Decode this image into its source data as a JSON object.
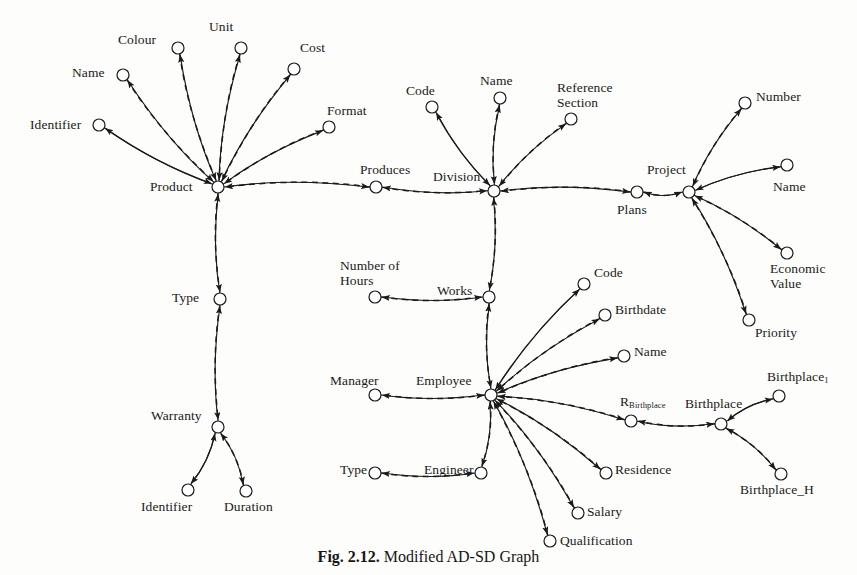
{
  "figure": {
    "caption_prefix": "Fig. 2.12.",
    "caption_text": " Modified AD-SD Graph",
    "caption_full": "Fig. 2.12. Modified AD-SD Graph"
  },
  "style": {
    "node_radius": 6,
    "node_stroke": "#1a1a1a",
    "node_fill": "#ffffff",
    "edge_color": "#1a1a1a",
    "solid_edge_label": "solid arrow (derivation edge)",
    "dashed_edge_label": "dashed arrow (dependency edge)"
  },
  "nodes": [
    {
      "id": "product",
      "label": "Product",
      "x": 218,
      "y": 187,
      "lx": 150,
      "ly": 180,
      "align": "left"
    },
    {
      "id": "p_identifier",
      "label": "Identifier",
      "x": 99,
      "y": 125,
      "lx": 30,
      "ly": 118,
      "align": "left"
    },
    {
      "id": "p_name",
      "label": "Name",
      "x": 123,
      "y": 75,
      "lx": 72,
      "ly": 66,
      "align": "left"
    },
    {
      "id": "p_colour",
      "label": "Colour",
      "x": 178,
      "y": 48,
      "lx": 118,
      "ly": 33,
      "align": "left"
    },
    {
      "id": "p_unit",
      "label": "Unit",
      "x": 241,
      "y": 48,
      "lx": 209,
      "ly": 20,
      "align": "left"
    },
    {
      "id": "p_cost",
      "label": "Cost",
      "x": 294,
      "y": 69,
      "lx": 300,
      "ly": 41,
      "align": "left"
    },
    {
      "id": "p_format",
      "label": "Format",
      "x": 329,
      "y": 127,
      "lx": 327,
      "ly": 104,
      "align": "left"
    },
    {
      "id": "type1",
      "label": "Type",
      "x": 220,
      "y": 299,
      "lx": 172,
      "ly": 291,
      "align": "left"
    },
    {
      "id": "warranty",
      "label": "Warranty",
      "x": 218,
      "y": 427,
      "lx": 151,
      "ly": 409,
      "align": "left"
    },
    {
      "id": "w_identifier",
      "label": "Identifier",
      "x": 188,
      "y": 490,
      "lx": 141,
      "ly": 500,
      "align": "left"
    },
    {
      "id": "w_duration",
      "label": "Duration",
      "x": 246,
      "y": 491,
      "lx": 224,
      "ly": 500,
      "align": "left"
    },
    {
      "id": "produces",
      "label": "Produces",
      "x": 376,
      "y": 187,
      "lx": 360,
      "ly": 163,
      "align": "left"
    },
    {
      "id": "division",
      "label": "Division",
      "x": 494,
      "y": 191,
      "lx": 433,
      "ly": 170,
      "align": "left"
    },
    {
      "id": "d_code",
      "label": "Code",
      "x": 432,
      "y": 107,
      "lx": 406,
      "ly": 84,
      "align": "left"
    },
    {
      "id": "d_name",
      "label": "Name",
      "x": 500,
      "y": 98,
      "lx": 480,
      "ly": 74,
      "align": "left"
    },
    {
      "id": "d_refsection",
      "label": "Reference\nSection",
      "x": 571,
      "y": 119,
      "lx": 557,
      "ly": 81,
      "align": "left"
    },
    {
      "id": "plans",
      "label": "Plans",
      "x": 637,
      "y": 192,
      "lx": 617,
      "ly": 203,
      "align": "left"
    },
    {
      "id": "project",
      "label": "Project",
      "x": 689,
      "y": 192,
      "lx": 647,
      "ly": 163,
      "align": "left"
    },
    {
      "id": "pr_number",
      "label": "Number",
      "x": 745,
      "y": 103,
      "lx": 756,
      "ly": 90,
      "align": "left"
    },
    {
      "id": "pr_name",
      "label": "Name",
      "x": 787,
      "y": 165,
      "lx": 773,
      "ly": 180,
      "align": "left"
    },
    {
      "id": "pr_economicvalue",
      "label": "Economic\nValue",
      "x": 787,
      "y": 253,
      "lx": 770,
      "ly": 262,
      "align": "left"
    },
    {
      "id": "pr_priority",
      "label": "Priority",
      "x": 749,
      "y": 320,
      "lx": 755,
      "ly": 326,
      "align": "left"
    },
    {
      "id": "works",
      "label": "Works",
      "x": 489,
      "y": 297,
      "lx": 437,
      "ly": 284,
      "align": "left"
    },
    {
      "id": "numberofhours",
      "label": "Number of\nHours",
      "x": 375,
      "y": 297,
      "lx": 340,
      "ly": 259,
      "align": "left"
    },
    {
      "id": "employee",
      "label": "Employee",
      "x": 491,
      "y": 395,
      "lx": 416,
      "ly": 374,
      "align": "left"
    },
    {
      "id": "manager",
      "label": "Manager",
      "x": 375,
      "y": 395,
      "lx": 330,
      "ly": 374,
      "align": "left"
    },
    {
      "id": "engineer",
      "label": "Engineer",
      "x": 481,
      "y": 473,
      "lx": 424,
      "ly": 463,
      "align": "left"
    },
    {
      "id": "e_type",
      "label": "Type",
      "x": 375,
      "y": 473,
      "lx": 340,
      "ly": 463,
      "align": "left"
    },
    {
      "id": "e_code",
      "label": "Code",
      "x": 584,
      "y": 284,
      "lx": 594,
      "ly": 266,
      "align": "left"
    },
    {
      "id": "e_birthdate",
      "label": "Birthdate",
      "x": 605,
      "y": 315,
      "lx": 615,
      "ly": 303,
      "align": "left"
    },
    {
      "id": "e_name",
      "label": "Name",
      "x": 624,
      "y": 356,
      "lx": 634,
      "ly": 345,
      "align": "left"
    },
    {
      "id": "e_rbirthplace",
      "label": "R",
      "sub": "Birthplace",
      "x": 631,
      "y": 421,
      "lx": 620,
      "ly": 395,
      "align": "left"
    },
    {
      "id": "e_residence",
      "label": "Residence",
      "x": 606,
      "y": 473,
      "lx": 615,
      "ly": 463,
      "align": "left"
    },
    {
      "id": "e_salary",
      "label": "Salary",
      "x": 578,
      "y": 513,
      "lx": 587,
      "ly": 505,
      "align": "left"
    },
    {
      "id": "e_qualification",
      "label": "Qualification",
      "x": 550,
      "y": 541,
      "lx": 560,
      "ly": 534,
      "align": "left"
    },
    {
      "id": "birthplace",
      "label": "Birthplace",
      "x": 721,
      "y": 424,
      "lx": 685,
      "ly": 397,
      "align": "left"
    },
    {
      "id": "birthplace1",
      "label": "Birthplace",
      "sub": "1",
      "x": 779,
      "y": 396,
      "lx": 767,
      "ly": 370,
      "align": "left"
    },
    {
      "id": "birthplace_h",
      "label": "Birthplace_H",
      "x": 781,
      "y": 474,
      "lx": 740,
      "ly": 483,
      "align": "left"
    }
  ],
  "edges": [
    {
      "from": "product",
      "to": "p_identifier",
      "style": "solid",
      "route": "bow"
    },
    {
      "from": "p_identifier",
      "to": "product",
      "style": "solid",
      "route": "bow2"
    },
    {
      "from": "product",
      "to": "p_name",
      "style": "solid"
    },
    {
      "from": "p_name",
      "to": "product",
      "style": "dashed",
      "route": "bow"
    },
    {
      "from": "product",
      "to": "p_colour",
      "style": "solid"
    },
    {
      "from": "p_colour",
      "to": "product",
      "style": "dashed"
    },
    {
      "from": "product",
      "to": "p_unit",
      "style": "solid"
    },
    {
      "from": "p_unit",
      "to": "product",
      "style": "dashed"
    },
    {
      "from": "product",
      "to": "p_cost",
      "style": "solid"
    },
    {
      "from": "p_cost",
      "to": "product",
      "style": "dashed"
    },
    {
      "from": "product",
      "to": "p_format",
      "style": "solid"
    },
    {
      "from": "p_format",
      "to": "product",
      "style": "dashed"
    },
    {
      "from": "type1",
      "to": "product",
      "style": "solid"
    },
    {
      "from": "product",
      "to": "type1",
      "style": "dashed"
    },
    {
      "from": "warranty",
      "to": "type1",
      "style": "solid"
    },
    {
      "from": "type1",
      "to": "warranty",
      "style": "dashed"
    },
    {
      "from": "warranty",
      "to": "w_identifier",
      "style": "solid"
    },
    {
      "from": "w_identifier",
      "to": "warranty",
      "style": "solid"
    },
    {
      "from": "warranty",
      "to": "w_duration",
      "style": "solid"
    },
    {
      "from": "w_duration",
      "to": "warranty",
      "style": "dashed"
    },
    {
      "from": "product",
      "to": "produces",
      "style": "solid"
    },
    {
      "from": "produces",
      "to": "product",
      "style": "dashed"
    },
    {
      "from": "division",
      "to": "produces",
      "style": "solid"
    },
    {
      "from": "produces",
      "to": "division",
      "style": "dashed"
    },
    {
      "from": "division",
      "to": "d_code",
      "style": "solid"
    },
    {
      "from": "d_code",
      "to": "division",
      "style": "solid"
    },
    {
      "from": "division",
      "to": "d_name",
      "style": "solid"
    },
    {
      "from": "d_name",
      "to": "division",
      "style": "dashed"
    },
    {
      "from": "division",
      "to": "d_refsection",
      "style": "solid"
    },
    {
      "from": "d_refsection",
      "to": "division",
      "style": "dashed"
    },
    {
      "from": "division",
      "to": "plans",
      "style": "solid"
    },
    {
      "from": "plans",
      "to": "division",
      "style": "dashed"
    },
    {
      "from": "project",
      "to": "plans",
      "style": "solid"
    },
    {
      "from": "plans",
      "to": "project",
      "style": "dashed"
    },
    {
      "from": "project",
      "to": "pr_number",
      "style": "solid"
    },
    {
      "from": "pr_number",
      "to": "project",
      "style": "dashed"
    },
    {
      "from": "project",
      "to": "pr_name",
      "style": "solid"
    },
    {
      "from": "pr_name",
      "to": "project",
      "style": "solid"
    },
    {
      "from": "project",
      "to": "pr_economicvalue",
      "style": "solid"
    },
    {
      "from": "pr_economicvalue",
      "to": "project",
      "style": "dashed"
    },
    {
      "from": "project",
      "to": "pr_priority",
      "style": "solid"
    },
    {
      "from": "pr_priority",
      "to": "project",
      "style": "dashed"
    },
    {
      "from": "division",
      "to": "works",
      "style": "dashed"
    },
    {
      "from": "works",
      "to": "division",
      "style": "solid"
    },
    {
      "from": "works",
      "to": "numberofhours",
      "style": "solid"
    },
    {
      "from": "numberofhours",
      "to": "works",
      "style": "dashed"
    },
    {
      "from": "employee",
      "to": "works",
      "style": "solid"
    },
    {
      "from": "works",
      "to": "employee",
      "style": "dashed"
    },
    {
      "from": "employee",
      "to": "manager",
      "style": "dashed"
    },
    {
      "from": "manager",
      "to": "employee",
      "style": "solid"
    },
    {
      "from": "employee",
      "to": "engineer",
      "style": "dashed"
    },
    {
      "from": "engineer",
      "to": "employee",
      "style": "solid"
    },
    {
      "from": "engineer",
      "to": "e_type",
      "style": "solid"
    },
    {
      "from": "e_type",
      "to": "engineer",
      "style": "dashed"
    },
    {
      "from": "employee",
      "to": "e_code",
      "style": "solid"
    },
    {
      "from": "e_code",
      "to": "employee",
      "style": "solid"
    },
    {
      "from": "employee",
      "to": "e_birthdate",
      "style": "solid"
    },
    {
      "from": "e_birthdate",
      "to": "employee",
      "style": "dashed"
    },
    {
      "from": "employee",
      "to": "e_name",
      "style": "solid"
    },
    {
      "from": "e_name",
      "to": "employee",
      "style": "dashed"
    },
    {
      "from": "employee",
      "to": "e_rbirthplace",
      "style": "solid"
    },
    {
      "from": "e_rbirthplace",
      "to": "employee",
      "style": "dashed"
    },
    {
      "from": "employee",
      "to": "e_residence",
      "style": "solid"
    },
    {
      "from": "e_residence",
      "to": "employee",
      "style": "dashed"
    },
    {
      "from": "employee",
      "to": "e_salary",
      "style": "solid"
    },
    {
      "from": "e_salary",
      "to": "employee",
      "style": "dashed"
    },
    {
      "from": "employee",
      "to": "e_qualification",
      "style": "solid"
    },
    {
      "from": "e_qualification",
      "to": "employee",
      "style": "dashed"
    },
    {
      "from": "birthplace",
      "to": "e_rbirthplace",
      "style": "dashed"
    },
    {
      "from": "e_rbirthplace",
      "to": "birthplace",
      "style": "solid"
    },
    {
      "from": "birthplace",
      "to": "birthplace1",
      "style": "solid"
    },
    {
      "from": "birthplace1",
      "to": "birthplace",
      "style": "solid"
    },
    {
      "from": "birthplace",
      "to": "birthplace_h",
      "style": "solid"
    },
    {
      "from": "birthplace_h",
      "to": "birthplace",
      "style": "dashed"
    }
  ]
}
